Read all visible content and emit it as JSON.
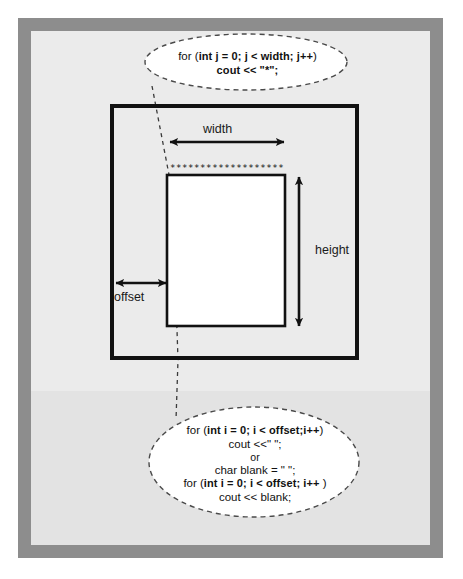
{
  "figure": {
    "colors": {
      "frame": "#8d8d8d",
      "paper": "#e9e9e9",
      "ink": "#111111",
      "bubble_fill": "#ffffff"
    }
  },
  "diagram": {
    "outer_box": {
      "label": "outer-bounding-box"
    },
    "inner_box": {
      "label": "drawn-rectangle"
    },
    "asterisk_row": "*******************",
    "dimensions": {
      "width_label": "width",
      "height_label": "height",
      "offset_label": "offset"
    }
  },
  "bubbles": {
    "top": {
      "name": "width-loop-callout",
      "lines": [
        {
          "prefix": "for (",
          "code": "int j = 0; j < width; j++",
          "suffix": ")"
        },
        {
          "prefix": "",
          "code": "cout << \"*\";",
          "suffix": ""
        }
      ],
      "line1_prefix": "for (",
      "line1_code": "int j = 0; j < width; j++",
      "line1_suffix": ")",
      "line2_code": "cout << \"*\";"
    },
    "bottom": {
      "name": "offset-loop-callout",
      "line1_prefix": "for (",
      "line1_code": "int i = 0; i < offset;i++",
      "line1_suffix": ")",
      "line2_text": "cout <<\" \";",
      "line3_text": "or",
      "line4_text": "char blank = \" \";",
      "line5_prefix": "for (",
      "line5_code": "int i = 0; i < offset; i++",
      "line5_suffix": " )",
      "line6_text": "cout << blank;"
    }
  }
}
